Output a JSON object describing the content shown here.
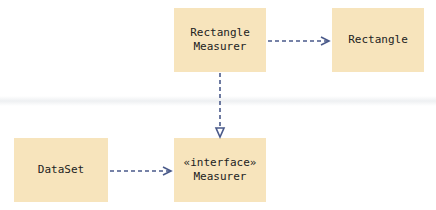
{
  "diagram": {
    "boxes": [
      {
        "id": "rectangle-measurer",
        "lines": [
          "Rectangle",
          "Measurer"
        ]
      },
      {
        "id": "rectangle",
        "lines": [
          "Rectangle"
        ]
      },
      {
        "id": "dataset",
        "lines": [
          "DataSet"
        ]
      },
      {
        "id": "measurer",
        "lines": [
          "«interface»",
          "Measurer"
        ]
      }
    ],
    "edges": [
      {
        "from": "rectangle-measurer",
        "to": "rectangle",
        "type": "dependency"
      },
      {
        "from": "rectangle-measurer",
        "to": "measurer",
        "type": "realization"
      },
      {
        "from": "dataset",
        "to": "measurer",
        "type": "dependency"
      }
    ],
    "colors": {
      "box_fill": "#f7e4bc",
      "arrow": "#4a5a8a"
    }
  }
}
